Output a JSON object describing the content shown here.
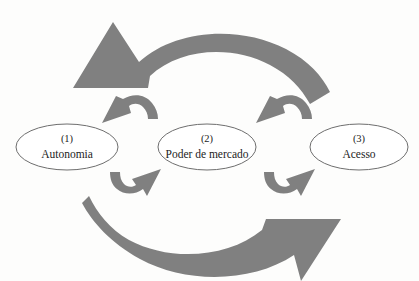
{
  "diagram": {
    "type": "cycle-diagram",
    "background_color": "#fdfdfc",
    "arrow_color": "#808080",
    "node_fill_color": "#ffffff",
    "node_stroke_color": "#6e6e6e",
    "text_color": "#1c1c1c",
    "nodes": [
      {
        "id": "autonomia",
        "index": "(1)",
        "label": "Autonomia",
        "cx": 67,
        "cy": 147,
        "rx": 51,
        "ry": 23
      },
      {
        "id": "poder-de-mercado",
        "index": "(2)",
        "label": "Poder de mercado",
        "cx": 207,
        "cy": 147,
        "rx": 49,
        "ry": 23
      },
      {
        "id": "acesso",
        "index": "(3)",
        "label": "Acesso",
        "cx": 359,
        "cy": 147,
        "rx": 49,
        "ry": 23
      }
    ],
    "arrows": [
      {
        "id": "top-sweep-arrow",
        "name": "large-arc-arrow-left",
        "direction": "right-to-left",
        "description": "Large curved arrow sweeping from right across the top and pointing left"
      },
      {
        "id": "bottom-sweep-arrow",
        "name": "large-arc-arrow-right",
        "direction": "left-to-right",
        "description": "Large curved arrow sweeping from left across the bottom and pointing up-right"
      },
      {
        "id": "small-arrow-upper-left",
        "name": "small-curved-arrow-leftward",
        "direction": "right-to-left",
        "description": "Small curved arrow above, between node 1 and node 2, pointing left"
      },
      {
        "id": "small-arrow-lower-left",
        "name": "small-curved-arrow-rightward",
        "direction": "left-to-right",
        "description": "Small curved arrow below, between node 1 and node 2, pointing right"
      },
      {
        "id": "small-arrow-upper-right",
        "name": "small-curved-arrow-leftward",
        "direction": "right-to-left",
        "description": "Small curved arrow above, between node 2 and node 3, pointing left"
      },
      {
        "id": "small-arrow-lower-right",
        "name": "small-curved-arrow-rightward",
        "direction": "left-to-right",
        "description": "Small curved arrow below, between node 2 and node 3, pointing right"
      }
    ]
  }
}
